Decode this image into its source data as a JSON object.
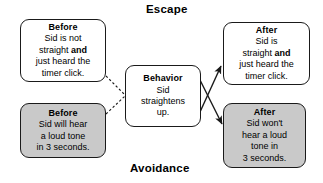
{
  "diagram": {
    "title_top": "Escape",
    "title_bottom": "Avoidance",
    "nodes": {
      "before_escape": {
        "header": "Before",
        "line1": "Sid is not",
        "line2_pre": "straight ",
        "line2_bold": "and",
        "line3": "just heard the",
        "line4": "timer click."
      },
      "before_avoidance": {
        "header": "Before",
        "line1": "Sid will hear",
        "line2": "a loud tone",
        "line3": "in 3 seconds."
      },
      "behavior": {
        "header": "Behavior",
        "line1": "Sid",
        "line2": "straightens",
        "line3": "up."
      },
      "after_escape": {
        "header": "After",
        "line1": "Sid is",
        "line2_pre": "straight ",
        "line2_bold": "and",
        "line3": "just heard the",
        "line4": "timer click."
      },
      "after_avoidance": {
        "header": "After",
        "line1": "Sid won't",
        "line2": "hear a loud",
        "line3": "tone in",
        "line4": "3 seconds."
      }
    },
    "colors": {
      "shaded_fill": "#c9c9c9",
      "plain_fill": "#ffffff",
      "stroke": "#1a1a1a",
      "background": "#ffffff"
    }
  }
}
